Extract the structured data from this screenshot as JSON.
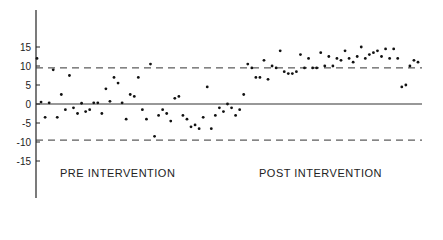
{
  "chart_data": {
    "type": "scatter",
    "title": "",
    "xlabel": "",
    "ylabel": "",
    "ylim": [
      -20,
      25
    ],
    "yticks": [
      15,
      10,
      5,
      0,
      -5,
      -10,
      -15
    ],
    "reference_lines": [
      {
        "y": 0,
        "style": "solid"
      },
      {
        "y": 9.5,
        "style": "dashed"
      },
      {
        "y": -9.5,
        "style": "dashed"
      }
    ],
    "annotations": [
      "PRE INTERVENTION",
      "POST INTERVENTION"
    ],
    "series": [
      {
        "name": "Pre intervention",
        "x": [
          1,
          2,
          3,
          4,
          5,
          6,
          7,
          8,
          9,
          10,
          11,
          12,
          13,
          14,
          15,
          16,
          17,
          18,
          19,
          20,
          21,
          22,
          23,
          24,
          25,
          26,
          27,
          28,
          29,
          30,
          31,
          32,
          33,
          34,
          35,
          36,
          37,
          38,
          39,
          40,
          41,
          42,
          43,
          44,
          45,
          46,
          47,
          48,
          49,
          50
        ],
        "y": [
          12,
          0.5,
          -3.5,
          0.3,
          9,
          -3.5,
          2.5,
          -1.5,
          7.5,
          -1,
          -2.5,
          0.2,
          -2,
          -1.5,
          0.3,
          0.3,
          -2.5,
          4,
          0.7,
          7,
          5.5,
          0.3,
          -4,
          2.5,
          2,
          7,
          -1.5,
          -4,
          10.5,
          -8.5,
          -3,
          -1.5,
          -2.5,
          -4.5,
          1.5,
          2,
          -3,
          -4,
          -6,
          -5.5,
          -6.5,
          -3.5,
          4.5,
          -6.5,
          -3,
          -1,
          -2,
          0,
          -1,
          -3
        ]
      },
      {
        "name": "Post intervention",
        "x": [
          51,
          52,
          53,
          54,
          55,
          56,
          57,
          58,
          59,
          60,
          61,
          62,
          63,
          64,
          65,
          66,
          67,
          68,
          69,
          70,
          71,
          72,
          73,
          74,
          75,
          76,
          77,
          78,
          79,
          80,
          81,
          82,
          83,
          84,
          85,
          86,
          87,
          88,
          89,
          90,
          91,
          92,
          93,
          94,
          95
        ],
        "y": [
          -1.5,
          2.5,
          10.5,
          9.5,
          7,
          7,
          11.5,
          6.5,
          10,
          9.5,
          14,
          8.5,
          8,
          8,
          8.5,
          13,
          9.5,
          12,
          9.5,
          9.5,
          13.5,
          10,
          12.5,
          10,
          12,
          11.5,
          14,
          12,
          11,
          12.5,
          15,
          12,
          13,
          13.5,
          14,
          12.5,
          14.5,
          12,
          14.5,
          12,
          4.5,
          5,
          10,
          11.5,
          11
        ]
      }
    ]
  },
  "axis": {
    "ticks": [
      "15",
      "10",
      "5",
      "0",
      "-5",
      "-10",
      "-15"
    ]
  },
  "labels": {
    "pre": "PRE INTERVENTION",
    "post": "POST INTERVENTION"
  }
}
